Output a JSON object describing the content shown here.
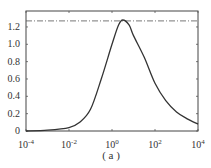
{
  "chart_data": {
    "type": "line",
    "title": "",
    "xlabel": "",
    "ylabel": "",
    "xscale": "log",
    "xlim": [
      0.0001,
      10000
    ],
    "ylim": [
      0,
      1.35
    ],
    "x_ticks": [
      "10^-4",
      "10^-2",
      "10^0",
      "10^2",
      "10^4"
    ],
    "y_ticks": [
      "0",
      "0.2",
      "0.4",
      "0.6",
      "0.8",
      "1.0",
      "1.2"
    ],
    "grid": false,
    "caption": "(a)",
    "series": [
      {
        "name": "curve",
        "style": "solid",
        "x_log10": [
          -4,
          -3,
          -2,
          -1.5,
          -1,
          -0.5,
          0,
          0.3,
          0.5,
          0.8,
          1,
          1.5,
          2,
          2.5,
          3,
          3.5,
          4
        ],
        "values": [
          0.0,
          0.01,
          0.04,
          0.1,
          0.25,
          0.6,
          1.0,
          1.22,
          1.28,
          1.22,
          1.1,
          0.85,
          0.55,
          0.35,
          0.22,
          0.14,
          0.08
        ]
      },
      {
        "name": "peak-reference",
        "style": "dash-dot",
        "constant": 1.27
      }
    ]
  },
  "labels": {
    "y": [
      "0",
      "0.2",
      "0.4",
      "0.6",
      "0.8",
      "1.0",
      "1.2"
    ],
    "x_base": "10",
    "x_exp": [
      "-4",
      "-2",
      "0",
      "2",
      "4"
    ],
    "caption": "( a )"
  }
}
